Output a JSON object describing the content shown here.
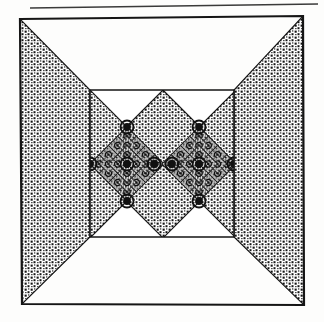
{
  "document": {
    "kind": "scanned-figure",
    "caption": "",
    "page_rule_present": "true"
  },
  "canvas": {
    "width": 324,
    "height": 322,
    "background_color": "#fdfdfc",
    "ink_color": "#1a1a1a",
    "stipple_color": "#111111"
  },
  "page_rule": {
    "name": "horizontal-rule",
    "x1": 30,
    "y1": 8,
    "x2": 318,
    "y2": 4,
    "thickness": 1.6,
    "color": "#3a3a3a"
  },
  "outer_frame": {
    "label": "outer-square",
    "corners": {
      "top_left": [
        20,
        19
      ],
      "top_right": [
        303,
        16
      ],
      "bottom_right": [
        304,
        305
      ],
      "bottom_left": [
        22,
        304
      ]
    },
    "stroke_width": 2.2,
    "stroke_color": "#151515",
    "fill": "none"
  },
  "inner_frame": {
    "label": "inner-square",
    "corners": {
      "top_left": [
        90,
        90
      ],
      "top_right": [
        234,
        90
      ],
      "bottom_right": [
        234,
        237
      ],
      "bottom_left": [
        90,
        237
      ]
    },
    "stroke_width": 1.6,
    "stroke_color": "#151515",
    "fill": "none"
  },
  "wings": {
    "description": "four stippled triangles joining outer square corners to inner square corners",
    "fill_style": "stipple",
    "items": [
      {
        "name": "wing-left",
        "points": "20,19 22,304 90,237 90,90"
      },
      {
        "name": "wing-right",
        "points": "303,16 304,305 234,237 234,90"
      },
      {
        "name": "wing-top-left-notch",
        "points": "20,19 90,90 163,90"
      },
      {
        "name": "wing-top-right-notch",
        "points": "303,16 234,90 163,90"
      },
      {
        "name": "wing-bottom-left-notch",
        "points": "22,304 90,237 163,237"
      },
      {
        "name": "wing-bottom-right-notch",
        "points": "304,305 234,237 163,237"
      }
    ]
  },
  "diamonds": {
    "description": "two large rotated squares (diamonds) meeting at the centre of the inner square",
    "half_width": 36,
    "half_height": 37,
    "items": [
      {
        "name": "diamond-left",
        "center": [
          127,
          164
        ],
        "rx": 37,
        "ry": 37
      },
      {
        "name": "diamond-right",
        "center": [
          199,
          164
        ],
        "rx": 37,
        "ry": 37
      }
    ],
    "stroke_color": "#151515",
    "stroke_width": 1.4
  },
  "background_diamonds": {
    "description": "stippled interstitial diamonds between and around the two main diamonds",
    "items": [
      {
        "name": "bg-diamond-centre",
        "center": [
          163,
          164
        ],
        "rx": 37,
        "ry": 37
      },
      {
        "name": "bg-diamond-left-edge",
        "center": [
          90,
          164
        ],
        "rx": 37,
        "ry": 37
      },
      {
        "name": "bg-diamond-right-edge",
        "center": [
          236,
          164
        ],
        "rx": 37,
        "ry": 37
      }
    ]
  },
  "vertex_nodes": {
    "description": "small ringed circles marking the vertices of the recursive diamonds",
    "radius_outer": 6.5,
    "radius_inner": 3.0,
    "stroke_color": "#111111",
    "points": [
      {
        "name": "node-left-outer",
        "cx": 90,
        "cy": 164
      },
      {
        "name": "node-left-top",
        "cx": 127,
        "cy": 127
      },
      {
        "name": "node-left-centre",
        "cx": 127,
        "cy": 164
      },
      {
        "name": "node-left-bottom",
        "cx": 127,
        "cy": 201
      },
      {
        "name": "node-left-inner",
        "cx": 154,
        "cy": 164
      },
      {
        "name": "node-right-inner",
        "cx": 172,
        "cy": 164
      },
      {
        "name": "node-right-top",
        "cx": 199,
        "cy": 127
      },
      {
        "name": "node-right-centre",
        "cx": 199,
        "cy": 164
      },
      {
        "name": "node-right-bottom",
        "cx": 199,
        "cy": 201
      },
      {
        "name": "node-right-outer",
        "cx": 234,
        "cy": 164
      }
    ]
  },
  "recursion": {
    "description": "self-similar sub-pattern repeated inside each main diamond",
    "levels": 3,
    "sub_scale": 0.5
  },
  "chart_data": {
    "type": "diagram",
    "title": ""
  }
}
